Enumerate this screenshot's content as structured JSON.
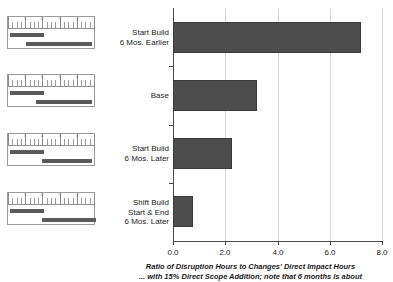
{
  "chart_data": {
    "type": "bar",
    "orientation": "horizontal",
    "title": "",
    "categories": [
      "Start Build\n6 Mos. Earlier",
      "Base",
      "Start Build\n6 Mos. Later",
      "Shift Build\nStart & End\n6 Mos. Later"
    ],
    "values": [
      7.2,
      3.2,
      2.25,
      0.75
    ],
    "xlabel": "Ratio of Disruption Hours to Changes' Direct Impact Hours",
    "ylabel": "",
    "xlim": [
      0.0,
      8.0
    ],
    "xticks": [
      "0.0",
      "2.0",
      "4.0",
      "6.0",
      "8.0"
    ],
    "xtick_values": [
      0.0,
      2.0,
      4.0,
      6.0,
      8.0
    ],
    "grid": "vertical",
    "legend": "none",
    "bar_color": "#4d4d4d"
  },
  "caption": {
    "line1": "Ratio of Disruption Hours to Changes' Direct Impact Hours",
    "line2": "... with 15% Direct Scope Addition; note that 6 months is about"
  },
  "thumbnails": [
    {
      "name": "start-build-6-mos-earlier",
      "ruler_numbers": [
        "1",
        "2",
        "3",
        "4"
      ],
      "bars": [
        {
          "label": "design",
          "left": 2,
          "width": 34
        },
        {
          "label": "build",
          "left": 18,
          "width": 66
        }
      ]
    },
    {
      "name": "base",
      "ruler_numbers": [
        "1",
        "2",
        "3",
        "4"
      ],
      "bars": [
        {
          "label": "design",
          "left": 2,
          "width": 34
        },
        {
          "label": "build",
          "left": 28,
          "width": 56
        }
      ]
    },
    {
      "name": "start-build-6-mos-later",
      "ruler_numbers": [
        "1",
        "2",
        "3",
        "4"
      ],
      "bars": [
        {
          "label": "design",
          "left": 2,
          "width": 34
        },
        {
          "label": "build",
          "left": 34,
          "width": 50
        }
      ]
    },
    {
      "name": "shift-build-start-and-end-6-mos-later",
      "ruler_numbers": [
        "1",
        "2",
        "3",
        "4"
      ],
      "bars": [
        {
          "label": "design",
          "left": 2,
          "width": 34
        },
        {
          "label": "build",
          "left": 34,
          "width": 54
        }
      ]
    }
  ]
}
